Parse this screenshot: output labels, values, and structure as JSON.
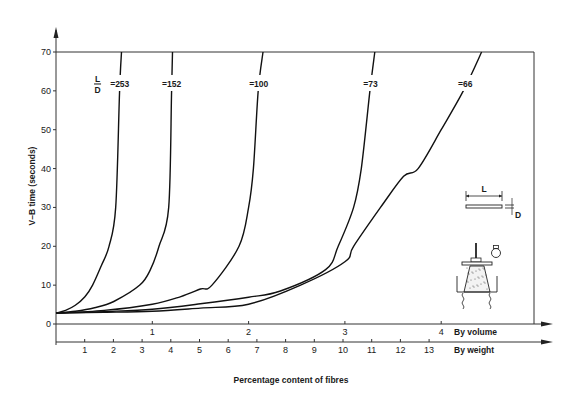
{
  "chart_data": {
    "type": "line",
    "title": "",
    "xlabel": "Percentage content of fibres",
    "ylabel": "V–B time (seconds)",
    "ylim": [
      0,
      70
    ],
    "yticks": [
      0,
      10,
      20,
      30,
      40,
      50,
      60,
      70
    ],
    "x_axes": [
      {
        "name": "By volume",
        "label": "By volume",
        "ticks": [
          1,
          2,
          3,
          4
        ],
        "range": [
          0,
          5
        ]
      },
      {
        "name": "By weight",
        "label": "By weight",
        "ticks": [
          1,
          2,
          3,
          4,
          5,
          6,
          7,
          8,
          9,
          10,
          11,
          12,
          13
        ],
        "range": [
          0,
          16.5
        ]
      }
    ],
    "grid": false,
    "series_label_prefix": {
      "numerator": "L",
      "denominator": "D"
    },
    "series": [
      {
        "name": "L/D = 253",
        "label": "=253",
        "x": [
          0,
          0.1,
          0.2,
          0.3,
          0.38,
          0.47,
          0.55,
          0.62,
          0.66,
          0.68
        ],
        "y": [
          2.8,
          3.5,
          4.8,
          7.0,
          10,
          15,
          20,
          30,
          60,
          70
        ]
      },
      {
        "name": "L/D = 152",
        "label": "=152",
        "x": [
          0,
          0.2,
          0.4,
          0.6,
          0.87,
          0.98,
          1.07,
          1.17,
          1.2,
          1.21
        ],
        "y": [
          2.8,
          3.3,
          4.2,
          5.8,
          10,
          14,
          20,
          30,
          60,
          70
        ]
      },
      {
        "name": "L/D = 100",
        "label": "=100",
        "x": [
          0,
          0.5,
          1.0,
          1.29,
          1.5,
          1.62,
          1.9,
          2.0,
          2.05,
          2.1,
          2.15
        ],
        "y": [
          2.8,
          3.5,
          5.1,
          7.0,
          9.0,
          10,
          20,
          30,
          40,
          60,
          70
        ]
      },
      {
        "name": "L/D = 73",
        "label": "=73",
        "x": [
          0,
          0.5,
          1.0,
          1.5,
          2.0,
          2.33,
          2.8,
          2.93,
          3.09,
          3.17,
          3.26,
          3.31
        ],
        "y": [
          2.8,
          3.2,
          3.8,
          5.2,
          6.9,
          8.5,
          14,
          20,
          30,
          40,
          60,
          70
        ]
      },
      {
        "name": "L/D = 66",
        "label": "=66",
        "x": [
          0,
          0.5,
          1.0,
          1.5,
          2.0,
          2.54,
          3.0,
          3.09,
          3.37,
          3.61,
          3.76,
          4.0,
          4.23,
          4.42
        ],
        "y": [
          2.8,
          3.0,
          3.3,
          4.1,
          5.1,
          10,
          16,
          20,
          30,
          38,
          40,
          50,
          60,
          70
        ]
      }
    ]
  },
  "inset": {
    "fibre_length_label": "L",
    "fibre_diameter_label": "D"
  }
}
